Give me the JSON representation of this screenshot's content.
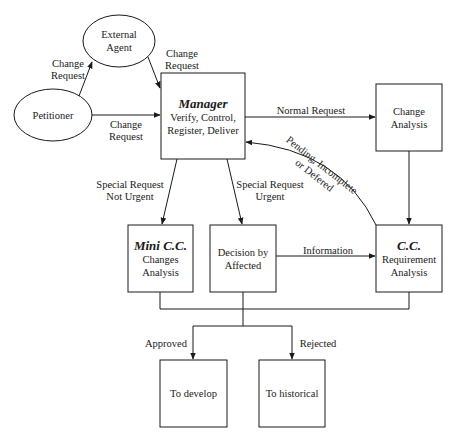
{
  "colors": {
    "stroke": "#1a1a1a",
    "background": "#ffffff"
  },
  "nodes": {
    "external_agent": {
      "shape": "ellipse",
      "line1": "External",
      "line2": "Agent"
    },
    "petitioner": {
      "shape": "ellipse",
      "label": "Petitioner"
    },
    "manager": {
      "shape": "box",
      "title": "Manager",
      "line1": "Verify, Control,",
      "line2": "Register, Deliver"
    },
    "change_analysis": {
      "shape": "box",
      "line1": "Change",
      "line2": "Analysis"
    },
    "mini_cc": {
      "shape": "box",
      "title": "Mini C.C.",
      "line1": "Changes",
      "line2": "Analysis"
    },
    "decision": {
      "shape": "box",
      "line1": "Decision by",
      "line2": "Affected"
    },
    "cc": {
      "shape": "box",
      "title": "C.C.",
      "line1": "Requirement",
      "line2": "Analysis"
    },
    "to_develop": {
      "shape": "box",
      "label": "To develop"
    },
    "to_historical": {
      "shape": "box",
      "label": "To historical"
    }
  },
  "edges": {
    "petitioner_to_external": {
      "line1": "Change",
      "line2": "Request"
    },
    "external_to_manager": {
      "line1": "Change",
      "line2": "Request"
    },
    "petitioner_to_manager": {
      "line1": "Change",
      "line2": "Request"
    },
    "manager_to_change_analysis": {
      "label": "Normal Request"
    },
    "cc_to_manager": {
      "line1": "Pending, Incomplete",
      "line2": "or Defered"
    },
    "manager_to_mini_cc": {
      "line1": "Special Request",
      "line2": "Not Urgent"
    },
    "manager_to_decision": {
      "line1": "Special Request",
      "line2": "Urgent"
    },
    "decision_to_cc": {
      "label": "Information"
    },
    "change_analysis_to_cc": {
      "label": ""
    },
    "merge_to_develop": {
      "label": "Approved"
    },
    "merge_to_historical": {
      "label": "Rejected"
    }
  }
}
